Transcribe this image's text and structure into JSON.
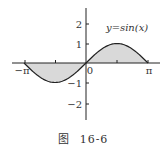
{
  "chart_data": {
    "type": "area",
    "title": "y=sin(x)",
    "function": "sin(x)",
    "xlabel": "",
    "ylabel": "",
    "xlim": [
      -3.14159,
      3.14159
    ],
    "ylim": [
      -2.6,
      2.6
    ],
    "x_ticks": [
      {
        "value": -3.14159,
        "label": "−π"
      },
      {
        "value": -1.5708,
        "label": ""
      },
      {
        "value": 0,
        "label": "0"
      },
      {
        "value": 1.5708,
        "label": ""
      },
      {
        "value": 3.14159,
        "label": "π"
      }
    ],
    "y_ticks": [
      {
        "value": 2,
        "label": "2"
      },
      {
        "value": 1,
        "label": "1"
      },
      {
        "value": -1,
        "label": "−1"
      },
      {
        "value": -2,
        "label": "−2"
      }
    ],
    "series": [
      {
        "name": "y=sin(x)",
        "x": [
          -3.14159,
          -2.3562,
          -1.5708,
          -0.7854,
          0,
          0.7854,
          1.5708,
          2.3562,
          3.14159
        ],
        "values": [
          0,
          -0.7071,
          -1,
          -0.7071,
          0,
          0.7071,
          1,
          0.7071,
          0
        ]
      }
    ],
    "shaded_region": "area between curve and x-axis over [−π, π]",
    "grid": false,
    "legend": "none"
  },
  "labels": {
    "curve_label": "y=sin(x)",
    "x_neg_pi": "−π",
    "x_zero": "0",
    "x_pi": "π",
    "y_2": "2",
    "y_1": "1",
    "y_m1": "−1",
    "y_m2": "−2"
  },
  "caption": {
    "prefix": "图",
    "number": "16-6"
  },
  "colors": {
    "fill": "#d9d9d9",
    "stroke": "#222222"
  }
}
